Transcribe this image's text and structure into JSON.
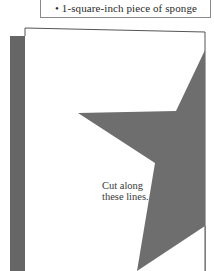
{
  "materials": {
    "items": [
      {
        "bullet": "•",
        "text": "1-square-inch piece of sponge"
      }
    ],
    "partial_line_above": "• ..."
  },
  "template": {
    "shape": "star",
    "label_line1": "Cut along",
    "label_line2": "these lines.",
    "colors": {
      "star_fill": "#6e6e6e",
      "shadow_strip": "#666666",
      "card_border": "#555555",
      "card_fill": "#ffffff",
      "box_border": "#8a8a8a",
      "text": "#333333"
    }
  }
}
